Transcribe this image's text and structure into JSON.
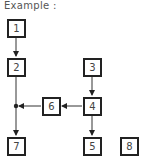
{
  "title": "Example :",
  "nodes": [
    {
      "id": "1",
      "label": "1"
    },
    {
      "id": "2",
      "label": "2"
    },
    {
      "id": "3",
      "label": "3"
    },
    {
      "id": "4",
      "label": "4"
    },
    {
      "id": "5",
      "label": "5"
    },
    {
      "id": "6",
      "label": "6"
    },
    {
      "id": "7",
      "label": "7"
    },
    {
      "id": "8",
      "label": "8"
    }
  ],
  "edges": [
    {
      "from": "1",
      "to": "2"
    },
    {
      "from": "3",
      "to": "4"
    },
    {
      "from": "4",
      "to": "5"
    },
    {
      "from": "4",
      "to": "6"
    },
    {
      "from": "6",
      "to": "junction"
    },
    {
      "from": "2",
      "to": "7",
      "via": "junction"
    }
  ]
}
